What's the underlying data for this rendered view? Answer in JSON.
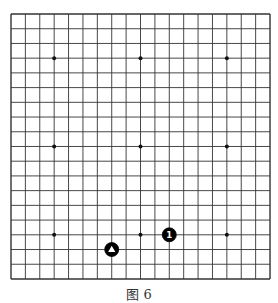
{
  "board": {
    "size": 19,
    "origin": {
      "x": 11,
      "y": 14
    },
    "spacing": {
      "x": 14.39,
      "y": 14.72
    },
    "line_color": "#333333",
    "star_points": [
      [
        3,
        3
      ],
      [
        9,
        3
      ],
      [
        15,
        3
      ],
      [
        3,
        9
      ],
      [
        9,
        9
      ],
      [
        15,
        9
      ],
      [
        3,
        15
      ],
      [
        9,
        15
      ],
      [
        15,
        15
      ]
    ],
    "stones": [
      {
        "col": 11,
        "row": 15,
        "color": "black",
        "label": "1",
        "mark": "number"
      },
      {
        "col": 7,
        "row": 16,
        "color": "black",
        "label": "",
        "mark": "triangle"
      }
    ]
  },
  "caption": "图 6"
}
